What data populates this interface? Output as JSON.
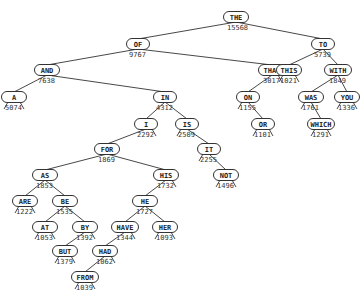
{
  "diagram": {
    "type": "binary-search-tree",
    "nodes": [
      {
        "id": "THE",
        "word": "THE",
        "count": "15568",
        "x": 236,
        "y": 17,
        "w": 26
      },
      {
        "id": "OF",
        "word": "OF",
        "count": "9767",
        "x": 138,
        "y": 44,
        "w": 24
      },
      {
        "id": "TO",
        "word": "TO",
        "count": "5739",
        "x": 323,
        "y": 44,
        "w": 24
      },
      {
        "id": "AND",
        "word": "AND",
        "count": "7638",
        "x": 47,
        "y": 70,
        "w": 26
      },
      {
        "id": "THAT",
        "word": "THAT",
        "count": "3017",
        "x": 272,
        "y": 70,
        "w": 28
      },
      {
        "id": "THIS",
        "word": "THIS",
        "count": "1021",
        "x": 289,
        "y": 70,
        "w": 26
      },
      {
        "id": "WITH",
        "word": "WITH",
        "count": "1849",
        "x": 338,
        "y": 70,
        "w": 28
      },
      {
        "id": "A",
        "word": "A",
        "count": "5074",
        "x": 14,
        "y": 97,
        "w": 26
      },
      {
        "id": "IN",
        "word": "IN",
        "count": "4312",
        "x": 165,
        "y": 97,
        "w": 24
      },
      {
        "id": "ON",
        "word": "ON",
        "count": "1155",
        "x": 248,
        "y": 97,
        "w": 24
      },
      {
        "id": "WAS",
        "word": "WAS",
        "count": "1761",
        "x": 311,
        "y": 97,
        "w": 26
      },
      {
        "id": "YOU",
        "word": "YOU",
        "count": "1336",
        "x": 347,
        "y": 97,
        "w": 26
      },
      {
        "id": "I",
        "word": "I",
        "count": "2292",
        "x": 146,
        "y": 124,
        "w": 24
      },
      {
        "id": "IS",
        "word": "IS",
        "count": "2509",
        "x": 187,
        "y": 124,
        "w": 24
      },
      {
        "id": "OR",
        "word": "OR",
        "count": "1101",
        "x": 263,
        "y": 124,
        "w": 24
      },
      {
        "id": "WHICH",
        "word": "WHICH",
        "count": "1291",
        "x": 321,
        "y": 124,
        "w": 28
      },
      {
        "id": "FOR",
        "word": "FOR",
        "count": "1869",
        "x": 107,
        "y": 149,
        "w": 26
      },
      {
        "id": "IT",
        "word": "IT",
        "count": "2255",
        "x": 209,
        "y": 149,
        "w": 24
      },
      {
        "id": "AS",
        "word": "AS",
        "count": "1853",
        "x": 45,
        "y": 175,
        "w": 26
      },
      {
        "id": "HIS",
        "word": "HIS",
        "count": "1732",
        "x": 166,
        "y": 175,
        "w": 26
      },
      {
        "id": "NOT",
        "word": "NOT",
        "count": "1496",
        "x": 226,
        "y": 175,
        "w": 26
      },
      {
        "id": "ARE",
        "word": "ARE",
        "count": "1222",
        "x": 25,
        "y": 201,
        "w": 26
      },
      {
        "id": "BE",
        "word": "BE",
        "count": "1535",
        "x": 65,
        "y": 201,
        "w": 26
      },
      {
        "id": "HE",
        "word": "HE",
        "count": "1727",
        "x": 145,
        "y": 201,
        "w": 26
      },
      {
        "id": "AT",
        "word": "AT",
        "count": "1053",
        "x": 45,
        "y": 227,
        "w": 26
      },
      {
        "id": "BY",
        "word": "BY",
        "count": "1392",
        "x": 85,
        "y": 227,
        "w": 26
      },
      {
        "id": "HAVE",
        "word": "HAVE",
        "count": "1344",
        "x": 125,
        "y": 227,
        "w": 28
      },
      {
        "id": "HER",
        "word": "HER",
        "count": "1093",
        "x": 165,
        "y": 227,
        "w": 26
      },
      {
        "id": "BUT",
        "word": "BUT",
        "count": "1379",
        "x": 65,
        "y": 251,
        "w": 26
      },
      {
        "id": "HAD",
        "word": "HAD",
        "count": "1062",
        "x": 105,
        "y": 251,
        "w": 26
      },
      {
        "id": "FROM",
        "word": "FROM",
        "count": "1039",
        "x": 85,
        "y": 277,
        "w": 28
      }
    ],
    "edges": [
      [
        "THE",
        "OF"
      ],
      [
        "THE",
        "TO"
      ],
      [
        "OF",
        "AND"
      ],
      [
        "OF",
        "THAT"
      ],
      [
        "TO",
        "THIS"
      ],
      [
        "TO",
        "WITH"
      ],
      [
        "AND",
        "A"
      ],
      [
        "AND",
        "IN"
      ],
      [
        "THAT",
        "ON"
      ],
      [
        "WITH",
        "WAS"
      ],
      [
        "WITH",
        "YOU"
      ],
      [
        "IN",
        "I"
      ],
      [
        "IN",
        "IS"
      ],
      [
        "ON",
        "OR"
      ],
      [
        "WAS",
        "WHICH"
      ],
      [
        "I",
        "FOR"
      ],
      [
        "IS",
        "IT"
      ],
      [
        "IT",
        "NOT"
      ],
      [
        "FOR",
        "AS"
      ],
      [
        "FOR",
        "HIS"
      ],
      [
        "AS",
        "ARE"
      ],
      [
        "AS",
        "BE"
      ],
      [
        "BE",
        "AT"
      ],
      [
        "BE",
        "BY"
      ],
      [
        "HIS",
        "HE"
      ],
      [
        "HE",
        "HAVE"
      ],
      [
        "HE",
        "HER"
      ],
      [
        "BY",
        "BUT"
      ],
      [
        "HAVE",
        "HAD"
      ],
      [
        "HAD",
        "FROM"
      ]
    ]
  }
}
